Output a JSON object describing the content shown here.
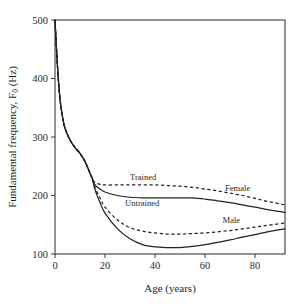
{
  "chart_data": {
    "type": "line",
    "title": "",
    "xlabel": "Age (years)",
    "ylabel": "Fundamental frequency, F0 (Hz)",
    "ylabel_main": "Fundamental frequency, F",
    "ylabel_sub": "0",
    "ylabel_unit": " (Hz)",
    "xlim": [
      0,
      92
    ],
    "ylim": [
      100,
      500
    ],
    "xticks": [
      0,
      20,
      40,
      60,
      80
    ],
    "xtick_labels": [
      "0",
      "20",
      "40",
      "60",
      "80"
    ],
    "yticks": [
      100,
      200,
      300,
      400,
      500
    ],
    "ytick_labels": [
      "100",
      "200",
      "300",
      "400",
      "500"
    ],
    "grid": false,
    "legend_position": "inline-annotations",
    "annotations": [
      {
        "text": "Trained",
        "x": 30,
        "y": 232
      },
      {
        "text": "Untrained",
        "x": 28,
        "y": 188
      },
      {
        "text": "Female",
        "x": 68,
        "y": 212
      },
      {
        "text": "Male",
        "x": 67,
        "y": 158
      }
    ],
    "series": [
      {
        "name": "Female trained",
        "style": "dashed",
        "x": [
          0,
          1,
          2,
          3,
          4,
          6,
          8,
          10,
          12,
          14,
          15,
          16,
          18,
          20,
          25,
          30,
          35,
          40,
          45,
          50,
          55,
          60,
          65,
          70,
          75,
          80,
          85,
          92
        ],
        "values": [
          500,
          420,
          365,
          335,
          315,
          295,
          282,
          272,
          258,
          238,
          228,
          222,
          219,
          218,
          218,
          218,
          218,
          218,
          217,
          216,
          214,
          211,
          208,
          204,
          200,
          195,
          190,
          184
        ]
      },
      {
        "name": "Female untrained",
        "style": "solid",
        "x": [
          0,
          1,
          2,
          3,
          4,
          6,
          8,
          10,
          12,
          14,
          15,
          16,
          18,
          20,
          25,
          30,
          35,
          40,
          45,
          50,
          55,
          60,
          65,
          70,
          75,
          80,
          85,
          92
        ],
        "values": [
          500,
          420,
          365,
          335,
          315,
          295,
          282,
          272,
          258,
          238,
          228,
          218,
          211,
          206,
          200,
          197,
          196,
          196,
          196,
          196,
          196,
          194,
          191,
          188,
          184,
          180,
          176,
          171
        ]
      },
      {
        "name": "Male trained",
        "style": "dashed",
        "x": [
          0,
          1,
          2,
          3,
          4,
          6,
          8,
          10,
          12,
          14,
          15,
          16,
          18,
          20,
          25,
          30,
          35,
          40,
          45,
          50,
          55,
          60,
          65,
          70,
          75,
          80,
          85,
          92
        ],
        "values": [
          500,
          420,
          365,
          335,
          315,
          295,
          282,
          272,
          258,
          238,
          228,
          214,
          196,
          180,
          158,
          145,
          139,
          136,
          134,
          134,
          135,
          136,
          138,
          140,
          143,
          146,
          149,
          153
        ]
      },
      {
        "name": "Male untrained",
        "style": "solid",
        "x": [
          0,
          1,
          2,
          3,
          4,
          6,
          8,
          10,
          12,
          14,
          15,
          16,
          18,
          20,
          25,
          30,
          35,
          40,
          45,
          50,
          55,
          60,
          65,
          70,
          75,
          80,
          85,
          92
        ],
        "values": [
          500,
          420,
          365,
          335,
          315,
          295,
          282,
          272,
          258,
          238,
          228,
          210,
          188,
          170,
          143,
          126,
          116,
          112,
          111,
          111,
          113,
          116,
          120,
          124,
          129,
          133,
          138,
          143
        ]
      }
    ]
  }
}
